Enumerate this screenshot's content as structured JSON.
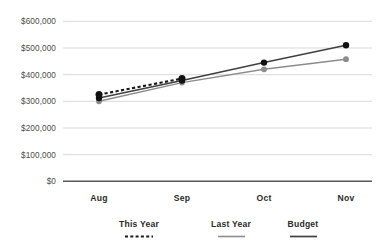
{
  "chart_data": {
    "type": "line",
    "title": "",
    "subtitle": "",
    "xlabel": "",
    "ylabel": "",
    "categories": [
      "Aug",
      "Sep",
      "Oct",
      "Nov"
    ],
    "ylim": [
      0,
      600000
    ],
    "ytick_values": [
      0,
      100000,
      200000,
      300000,
      400000,
      500000,
      600000
    ],
    "ytick_labels": [
      "$0",
      "$100,000",
      "$200,000",
      "$300,000",
      "$400,000",
      "$500,000",
      "$600,000"
    ],
    "grid": true,
    "grid_axis": "y",
    "legend_position": "bottom",
    "series": [
      {
        "name": "This Year",
        "style": "dotted",
        "color": "#1a1a1a",
        "marker": "circle",
        "values": [
          325000,
          385000,
          null,
          null
        ]
      },
      {
        "name": "Last Year",
        "style": "solid",
        "color": "#8c8c8c",
        "marker": "circle",
        "values": [
          300000,
          370000,
          420000,
          458000
        ]
      },
      {
        "name": "Budget",
        "style": "solid",
        "color": "#404040",
        "marker": "circle",
        "values": [
          312000,
          378000,
          445000,
          510000
        ]
      }
    ]
  },
  "axes": {
    "y_labels": [
      "$600,000",
      "$500,000",
      "$400,000",
      "$300,000",
      "$200,000",
      "$100,000",
      "$0"
    ],
    "x_labels": [
      "Aug",
      "Sep",
      "Oct",
      "Nov"
    ]
  },
  "legend": {
    "items": [
      {
        "label": "This Year",
        "swatch": "dotted-line-swatch",
        "color": "#1a1a1a"
      },
      {
        "label": "Last Year",
        "swatch": "solid-line-swatch",
        "color": "#8c8c8c"
      },
      {
        "label": "Budget",
        "swatch": "solid-line-swatch",
        "color": "#404040"
      }
    ]
  },
  "colors": {
    "grid": "#d9d9d9",
    "baseline": "#595959",
    "this_year": "#1a1a1a",
    "last_year": "#8c8c8c",
    "budget": "#404040",
    "tick_text": "#4c4c4c",
    "label_text": "#2b2b2b",
    "background": "#ffffff"
  }
}
